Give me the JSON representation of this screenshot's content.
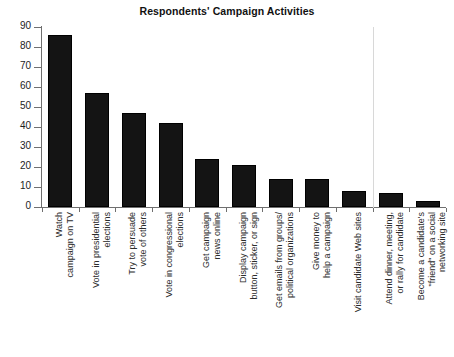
{
  "chart_data": {
    "type": "bar",
    "title": "Respondents' Campaign Activities",
    "xlabel": "",
    "ylabel": "",
    "ylim": [
      0,
      90
    ],
    "yticks": [
      0,
      10,
      20,
      30,
      40,
      50,
      60,
      70,
      80,
      90
    ],
    "grid": false,
    "legend": "none",
    "bar_color": "#141414",
    "axis_color": "#6f6f6f",
    "separator_after_index": 8,
    "categories": [
      "Watch campaign on TV",
      "Vote in presidential elections",
      "Try to persuade vote of others",
      "Vote in congressional elections",
      "Get campaign news online",
      "Display campaign button, sticker, or sign",
      "Get emails from groups/ political organizations",
      "Give money to help a campaign",
      "Visit candidate Web sites",
      "Attend dinner, meeting, or rally for candidate",
      "Become a candidate's \"friend\" on a social networking site"
    ],
    "category_lines": [
      [
        "Watch",
        "campaign on TV"
      ],
      [
        "Vote in presidential",
        "elections"
      ],
      [
        "Try to persuade",
        "vote of others"
      ],
      [
        "Vote in congressional",
        "elections"
      ],
      [
        "Get campaign",
        "news online"
      ],
      [
        "Display campaign",
        "button, sticker, or sign"
      ],
      [
        "Get emails from groups/",
        "political organizations"
      ],
      [
        "Give money to",
        "help a campaign"
      ],
      [
        "Visit candidate Web sites"
      ],
      [
        "Attend dinner, meeting,",
        "or rally for candidate"
      ],
      [
        "Become a candidate's",
        "\"friend\" on a social",
        "networking site"
      ]
    ],
    "values": [
      86,
      57,
      47,
      42,
      24,
      21,
      14,
      14,
      8,
      7,
      3
    ]
  }
}
